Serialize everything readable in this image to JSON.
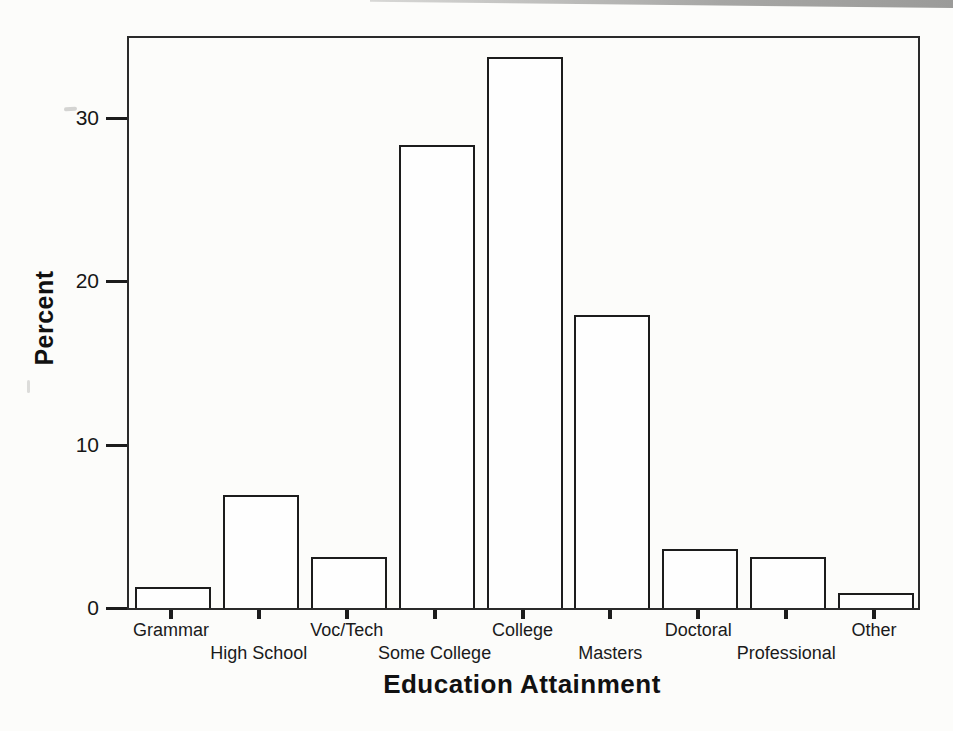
{
  "page": {
    "kind": "scanned-textbook-figure",
    "background_color": "#fcfcfa",
    "ink_color": "#1c1c1c",
    "scan_band_color": "#a6a6a4"
  },
  "chart_data": {
    "type": "bar",
    "title": "",
    "xlabel": "Education Attainment",
    "ylabel": "Percent",
    "categories": [
      "Grammar",
      "High School",
      "Voc/Tech",
      "Some College",
      "College",
      "Masters",
      "Doctoral",
      "Professional",
      "Other"
    ],
    "values": [
      1.3,
      6.9,
      3.1,
      28.3,
      33.7,
      17.9,
      3.6,
      3.1,
      0.9
    ],
    "ylim": [
      0,
      35
    ],
    "yticks": [
      0,
      10,
      20,
      30
    ],
    "bar_fill": "#fefefe",
    "bar_edge": "#1c1c1c",
    "grid": false,
    "legend": false,
    "label_layout": "staggered-two-rows"
  }
}
